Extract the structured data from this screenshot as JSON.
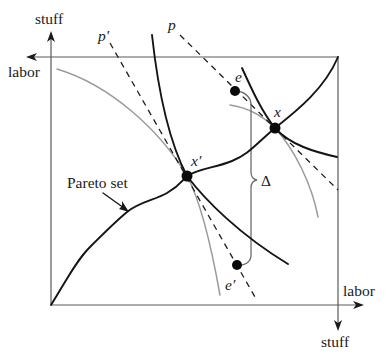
{
  "diagram": {
    "axes": {
      "top_left_vertical_label": "stuff",
      "top_left_horizontal_label": "labor",
      "bottom_right_horizontal_label": "labor",
      "bottom_right_vertical_label": "stuff"
    },
    "labels": {
      "p_prime": "p′",
      "p": "p",
      "e": "e",
      "x": "x",
      "x_prime": "x′",
      "e_prime": "e′",
      "delta": "Δ",
      "pareto_set": "Pareto set"
    },
    "points": {
      "e": {
        "cx": "235",
        "cy": "91",
        "r": "5"
      },
      "x": {
        "cx": "275",
        "cy": "128",
        "r": "5.5"
      },
      "x_prime": {
        "cx": "187",
        "cy": "176",
        "r": "5.5"
      },
      "e_prime": {
        "cx": "237",
        "cy": "265",
        "r": "5"
      }
    },
    "curves": {
      "pareto_set": "M51,305 C65,283 75,262 90,247 S115,222 127,212 S155,200 167,193 S182,181 187,176 C200,168 215,168 232,161 S255,145 275,128 C298,110 325,88 338,57",
      "indifference_through_x_prime": "M152,35 C158,90 168,140 187,176 C205,200 240,235 288,264",
      "indifference_through_x": "M242,68 C252,90 262,112 275,128 C290,145 315,152 337,157",
      "gray_curve_x_prime": "M57,69 C110,85 160,130 187,176 C200,200 212,250 220,295",
      "gray_curve_x": "M230,105 C250,108 265,118 275,128 C295,150 312,185 318,217",
      "price_line_p": "M180,35 L338,190",
      "price_line_p_prime": "M110,43 L255,297",
      "delta_bracket": "M235,91 C243,91 251,96 251,105 L251,172 Q251,179 257,180 Q251,181 251,188 L251,255 C251,262 245,266 237,265",
      "pareto_arrow": "M103,193 L124,208"
    },
    "colors": {
      "black_curves": "#141414",
      "gray_curves": "#9a9a9a",
      "box": "#5a5a5a",
      "dots": "#0a0a0a"
    }
  }
}
